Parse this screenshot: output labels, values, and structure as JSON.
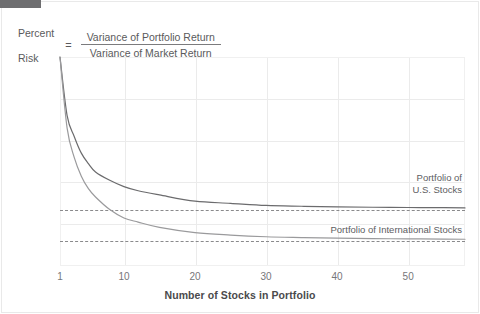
{
  "header": {
    "lhs_line1": "Percent",
    "lhs_line2": "Risk",
    "equals": "=",
    "numerator": "Variance of Portfolio Return",
    "denominator": "Variance of Market Return"
  },
  "chart_data": {
    "type": "line",
    "title": "",
    "xlabel": "Number of Stocks in Portfolio",
    "ylabel": "",
    "xlim": [
      1,
      58
    ],
    "ylim": [
      0,
      100
    ],
    "grid": true,
    "legend_position": "inline-right",
    "x_ticks": [
      "1",
      "10",
      "20",
      "30",
      "40",
      "50"
    ],
    "x_tick_values": [
      1,
      10,
      20,
      30,
      40,
      50
    ],
    "y_ticks": [
      "100",
      "80",
      "60",
      "40",
      "20"
    ],
    "y_tick_values": [
      100,
      80,
      60,
      40,
      20
    ],
    "annotation_ticks": [
      {
        "label": "27%",
        "value": 27
      },
      {
        "label": "12%",
        "value": 12
      }
    ],
    "reference_lines": [
      {
        "label": "27%",
        "value": 27,
        "style": "dashed"
      },
      {
        "label": "12%",
        "value": 12,
        "style": "dashed"
      }
    ],
    "series": [
      {
        "name": "Portfolio of U.S. Stocks",
        "label_line1": "Portfolio of",
        "label_line2": "U.S. Stocks",
        "color": "#6b6b6d",
        "asymptote": 27,
        "x": [
          1,
          2,
          3,
          4,
          5,
          6,
          8,
          10,
          12,
          15,
          20,
          25,
          30,
          35,
          40,
          45,
          50,
          55,
          58
        ],
        "values": [
          100,
          72,
          62,
          54,
          49,
          45,
          41,
          38,
          36,
          34,
          31,
          30,
          29,
          28.6,
          28.3,
          28.1,
          28,
          27.9,
          27.8
        ]
      },
      {
        "name": "Portfolio of International Stocks",
        "label_line1": "Portfolio of International Stocks",
        "label_line2": "",
        "color": "#9a9a9c",
        "asymptote": 12,
        "x": [
          1,
          2,
          3,
          4,
          5,
          6,
          8,
          10,
          12,
          15,
          20,
          25,
          30,
          35,
          40,
          45,
          50,
          55,
          58
        ],
        "values": [
          100,
          66,
          52,
          43,
          37,
          33,
          27,
          23,
          21,
          18.5,
          16,
          14.8,
          14,
          13.6,
          13.3,
          13.1,
          13,
          12.9,
          12.8
        ]
      }
    ]
  }
}
